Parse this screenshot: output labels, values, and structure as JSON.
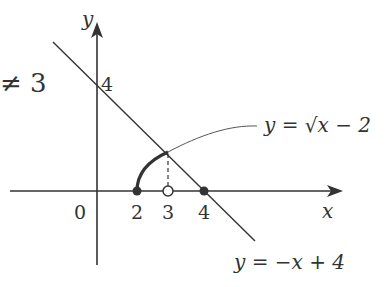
{
  "diagram": {
    "side_text": "≠ 3",
    "axes": {
      "x_label": "x",
      "y_label": "y",
      "origin_label": "0"
    },
    "y_tick": "4",
    "x_ticks": [
      "2",
      "3",
      "4"
    ],
    "curves": [
      {
        "name": "sqrt-curve",
        "label": "y = √x − 2",
        "domain": [
          2,
          3
        ]
      },
      {
        "name": "line",
        "label": "y = −x + 4"
      }
    ],
    "points": [
      {
        "x": 2,
        "y": 0,
        "type": "closed"
      },
      {
        "x": 3,
        "y": 0,
        "type": "open"
      },
      {
        "x": 4,
        "y": 0,
        "type": "closed"
      }
    ],
    "colors": {
      "ink": "#333333",
      "background": "#ffffff"
    }
  }
}
